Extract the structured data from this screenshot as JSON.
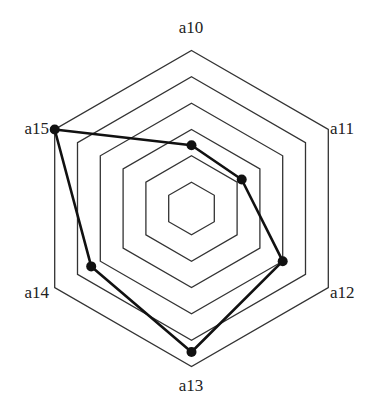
{
  "chart_data": {
    "type": "radar",
    "title": "",
    "axes": [
      "a10",
      "a11",
      "a12",
      "a13",
      "a14",
      "a15"
    ],
    "range": [
      0,
      6
    ],
    "rings": 6,
    "grid": true,
    "legend": null,
    "series": [
      {
        "name": "",
        "values": [
          2.4,
          2.2,
          4.0,
          5.45,
          4.4,
          6.0
        ],
        "color": "#111111",
        "marker": "filled-circle"
      }
    ]
  },
  "style": {
    "ring_color": "#333333",
    "line_color": "#111111",
    "background": "#ffffff"
  }
}
